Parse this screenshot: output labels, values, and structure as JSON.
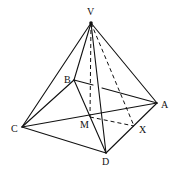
{
  "figure": {
    "type": "square-based pyramid",
    "labels": {
      "V": "V",
      "A": "A",
      "B": "B",
      "C": "C",
      "D": "D",
      "M": "M",
      "X": "X"
    },
    "solid_edges": [
      "VC",
      "VB",
      "VA",
      "VD",
      "CD",
      "DA",
      "CA",
      "BD",
      "BC",
      "BA"
    ],
    "dashed_edges": [
      "VM",
      "VX",
      "MX"
    ],
    "ink_color": "#111111"
  }
}
